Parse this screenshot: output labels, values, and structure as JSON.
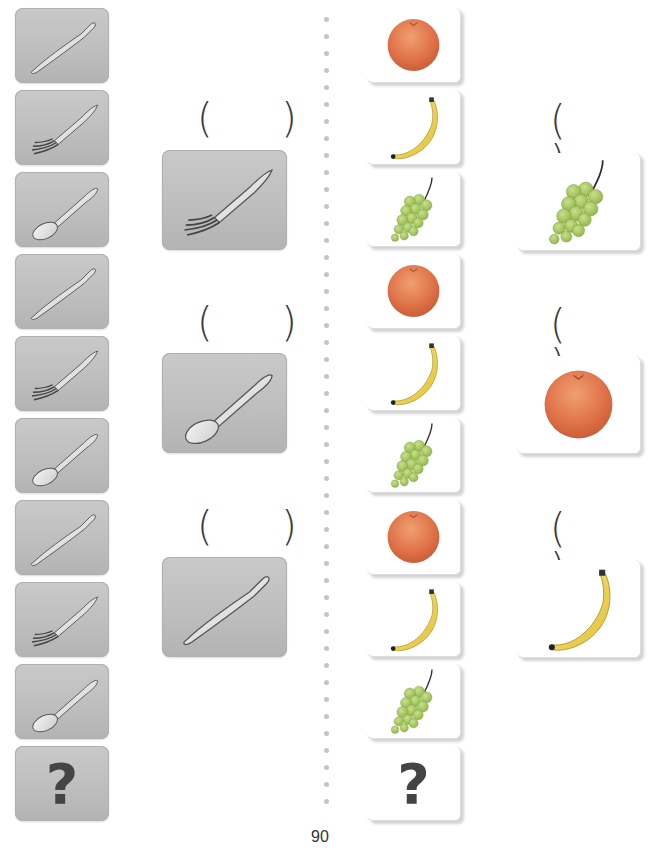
{
  "page_number": "90",
  "answer_blank": "( )",
  "question_mark": "?",
  "colors": {
    "card_gray": "#bfbfbf",
    "card_white": "#ffffff",
    "divider_dot": "#c4c4c4",
    "text": "#3a3a3a"
  },
  "left_sequence": {
    "items": [
      "knife",
      "fork",
      "spoon",
      "knife",
      "fork",
      "spoon",
      "knife",
      "fork",
      "spoon",
      "?"
    ]
  },
  "left_choices": {
    "items": [
      {
        "blank": "( )",
        "image": "fork"
      },
      {
        "blank": "( )",
        "image": "spoon"
      },
      {
        "blank": "( )",
        "image": "knife"
      }
    ]
  },
  "right_sequence": {
    "items": [
      "orange",
      "banana",
      "grapes",
      "orange",
      "banana",
      "grapes",
      "orange",
      "banana",
      "grapes",
      "?"
    ]
  },
  "right_choices": {
    "items": [
      {
        "blank": "( )",
        "image": "grapes"
      },
      {
        "blank": "( )",
        "image": "orange"
      },
      {
        "blank": "( )",
        "image": "banana"
      }
    ]
  }
}
